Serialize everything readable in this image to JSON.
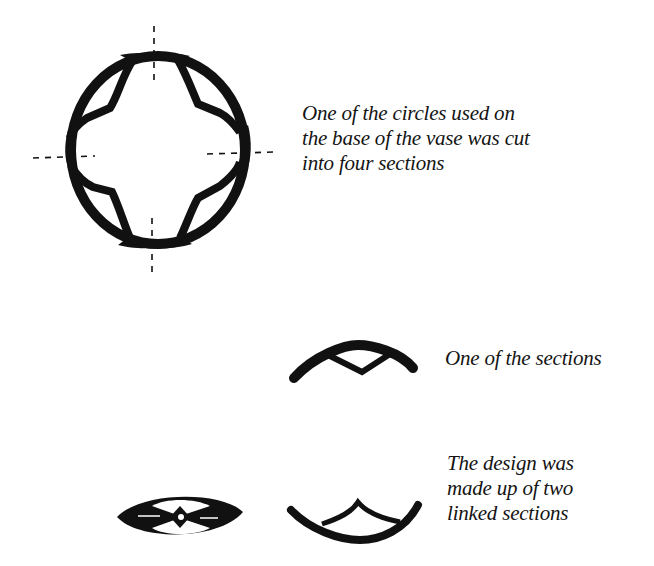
{
  "figure": {
    "captions": {
      "circle": {
        "lines": [
          "One of the circles used on",
          "the base of the vase was cut",
          "into four sections"
        ]
      },
      "section": {
        "lines": [
          "One of the sections"
        ]
      },
      "design": {
        "lines": [
          "The design was",
          "made up of two",
          "linked sections"
        ]
      }
    },
    "elements": [
      {
        "name": "circle-cut-into-four",
        "description": "Thick ring with four inner cusped lobes, crossed by dashed vertical and horizontal cut lines"
      },
      {
        "name": "single-section",
        "description": "One arched quarter-section of the ring with a V-shaped inner notch"
      },
      {
        "name": "linked-design",
        "description": "Two sections linked into an almond/eye shape with diamond center"
      },
      {
        "name": "inverted-section",
        "description": "One section flipped upside-down"
      }
    ],
    "colors": {
      "ink": "#111111",
      "background": "#ffffff"
    }
  }
}
